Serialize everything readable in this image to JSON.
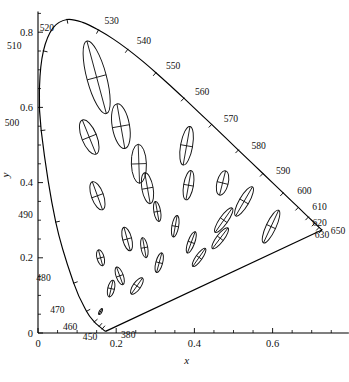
{
  "figure": {
    "title": "",
    "background_color": "#ffffff",
    "line_color": "#000000"
  },
  "axes": {
    "x_title": "x",
    "y_title": "y",
    "x_ticklabels": [
      "0",
      "0.2",
      "0.4",
      "0.6"
    ],
    "x_tickvalues": [
      0,
      0.2,
      0.4,
      0.6
    ],
    "y_ticklabels": [
      "0",
      "0.2",
      "0.4",
      "0.6",
      "0.8"
    ],
    "y_tickvalues": [
      0,
      0.2,
      0.4,
      0.6,
      0.8
    ],
    "x_minor_step": 0.05,
    "y_minor_step": 0.05,
    "xlim": [
      0,
      0.795
    ],
    "ylim": [
      0,
      0.855
    ],
    "grid": false
  },
  "chart_data": {
    "type": "scatter",
    "xlabel": "x",
    "ylabel": "y",
    "xlim": [
      0,
      0.795
    ],
    "ylim": [
      0,
      0.855
    ],
    "grid": false,
    "legend": "none",
    "spectral_locus": {
      "name": "Spectral locus (CIE 1931 2-deg)",
      "wavelength_labels": [
        380,
        450,
        460,
        470,
        480,
        490,
        500,
        510,
        520,
        530,
        540,
        550,
        560,
        570,
        580,
        590,
        600,
        610,
        620,
        630,
        650
      ],
      "points": [
        {
          "wl": 380,
          "x": 0.1741,
          "y": 0.005
        },
        {
          "wl": 390,
          "x": 0.1738,
          "y": 0.0049
        },
        {
          "wl": 400,
          "x": 0.1733,
          "y": 0.0048
        },
        {
          "wl": 410,
          "x": 0.1726,
          "y": 0.0048
        },
        {
          "wl": 420,
          "x": 0.1714,
          "y": 0.0051
        },
        {
          "wl": 430,
          "x": 0.1689,
          "y": 0.0069
        },
        {
          "wl": 440,
          "x": 0.1644,
          "y": 0.0109
        },
        {
          "wl": 450,
          "x": 0.1566,
          "y": 0.0177
        },
        {
          "wl": 460,
          "x": 0.144,
          "y": 0.0297
        },
        {
          "wl": 470,
          "x": 0.1241,
          "y": 0.0578
        },
        {
          "wl": 480,
          "x": 0.0913,
          "y": 0.1327
        },
        {
          "wl": 490,
          "x": 0.0454,
          "y": 0.295
        },
        {
          "wl": 500,
          "x": 0.0082,
          "y": 0.5384
        },
        {
          "wl": 505,
          "x": 0.0039,
          "y": 0.6548
        },
        {
          "wl": 510,
          "x": 0.0139,
          "y": 0.7502
        },
        {
          "wl": 515,
          "x": 0.0389,
          "y": 0.812
        },
        {
          "wl": 520,
          "x": 0.0743,
          "y": 0.8338
        },
        {
          "wl": 525,
          "x": 0.1142,
          "y": 0.8262
        },
        {
          "wl": 530,
          "x": 0.1547,
          "y": 0.8059
        },
        {
          "wl": 535,
          "x": 0.1929,
          "y": 0.7816
        },
        {
          "wl": 540,
          "x": 0.2296,
          "y": 0.7543
        },
        {
          "wl": 545,
          "x": 0.2658,
          "y": 0.7243
        },
        {
          "wl": 550,
          "x": 0.3016,
          "y": 0.6923
        },
        {
          "wl": 555,
          "x": 0.3373,
          "y": 0.6589
        },
        {
          "wl": 560,
          "x": 0.3731,
          "y": 0.6245
        },
        {
          "wl": 565,
          "x": 0.4087,
          "y": 0.5896
        },
        {
          "wl": 570,
          "x": 0.4441,
          "y": 0.5547
        },
        {
          "wl": 575,
          "x": 0.4788,
          "y": 0.5202
        },
        {
          "wl": 580,
          "x": 0.5125,
          "y": 0.4866
        },
        {
          "wl": 585,
          "x": 0.5448,
          "y": 0.4544
        },
        {
          "wl": 590,
          "x": 0.5752,
          "y": 0.4242
        },
        {
          "wl": 595,
          "x": 0.6029,
          "y": 0.3965
        },
        {
          "wl": 600,
          "x": 0.627,
          "y": 0.3725
        },
        {
          "wl": 605,
          "x": 0.6482,
          "y": 0.3514
        },
        {
          "wl": 610,
          "x": 0.6658,
          "y": 0.334
        },
        {
          "wl": 615,
          "x": 0.6801,
          "y": 0.3197
        },
        {
          "wl": 620,
          "x": 0.6915,
          "y": 0.3083
        },
        {
          "wl": 625,
          "x": 0.7006,
          "y": 0.2993
        },
        {
          "wl": 630,
          "x": 0.7079,
          "y": 0.292
        },
        {
          "wl": 635,
          "x": 0.714,
          "y": 0.2859
        },
        {
          "wl": 640,
          "x": 0.719,
          "y": 0.2809
        },
        {
          "wl": 645,
          "x": 0.723,
          "y": 0.277
        },
        {
          "wl": 650,
          "x": 0.726,
          "y": 0.274
        }
      ]
    },
    "purple_line": {
      "name": "Line of purples",
      "from": {
        "x": 0.726,
        "y": 0.274
      },
      "to": {
        "x": 0.1741,
        "y": 0.005
      }
    },
    "ellipses": {
      "name": "MacAdam ellipses (10x actual size)",
      "scale_note": "axes enlarged 10x",
      "items": [
        {
          "id": 1,
          "cx": 0.16,
          "cy": 0.057,
          "a": 0.0085,
          "b": 0.0035,
          "theta_deg": 62
        },
        {
          "id": 2,
          "cx": 0.187,
          "cy": 0.118,
          "a": 0.022,
          "b": 0.009,
          "theta_deg": 77
        },
        {
          "id": 3,
          "cx": 0.253,
          "cy": 0.125,
          "a": 0.025,
          "b": 0.01,
          "theta_deg": 55
        },
        {
          "id": 4,
          "cx": 0.15,
          "cy": 0.68,
          "a": 0.096,
          "b": 0.026,
          "theta_deg": 105
        },
        {
          "id": 5,
          "cx": 0.131,
          "cy": 0.521,
          "a": 0.047,
          "b": 0.02,
          "theta_deg": 112
        },
        {
          "id": 6,
          "cx": 0.212,
          "cy": 0.55,
          "a": 0.058,
          "b": 0.023,
          "theta_deg": 100
        },
        {
          "id": 7,
          "cx": 0.258,
          "cy": 0.45,
          "a": 0.05,
          "b": 0.02,
          "theta_deg": 92
        },
        {
          "id": 8,
          "cx": 0.152,
          "cy": 0.365,
          "a": 0.038,
          "b": 0.016,
          "theta_deg": 110
        },
        {
          "id": 9,
          "cx": 0.28,
          "cy": 0.385,
          "a": 0.04,
          "b": 0.015,
          "theta_deg": 100
        },
        {
          "id": 10,
          "cx": 0.38,
          "cy": 0.498,
          "a": 0.05,
          "b": 0.016,
          "theta_deg": 80
        },
        {
          "id": 11,
          "cx": 0.16,
          "cy": 0.2,
          "a": 0.021,
          "b": 0.0095,
          "theta_deg": 105
        },
        {
          "id": 12,
          "cx": 0.228,
          "cy": 0.25,
          "a": 0.031,
          "b": 0.012,
          "theta_deg": 105
        },
        {
          "id": 13,
          "cx": 0.305,
          "cy": 0.323,
          "a": 0.026,
          "b": 0.009,
          "theta_deg": 100
        },
        {
          "id": 14,
          "cx": 0.385,
          "cy": 0.393,
          "a": 0.038,
          "b": 0.013,
          "theta_deg": 80
        },
        {
          "id": 15,
          "cx": 0.472,
          "cy": 0.399,
          "a": 0.032,
          "b": 0.015,
          "theta_deg": 76
        },
        {
          "id": 16,
          "cx": 0.527,
          "cy": 0.35,
          "a": 0.043,
          "b": 0.013,
          "theta_deg": 60
        },
        {
          "id": 17,
          "cx": 0.475,
          "cy": 0.3,
          "a": 0.038,
          "b": 0.011,
          "theta_deg": 55
        },
        {
          "id": 18,
          "cx": 0.351,
          "cy": 0.284,
          "a": 0.028,
          "b": 0.009,
          "theta_deg": 80
        },
        {
          "id": 19,
          "cx": 0.272,
          "cy": 0.227,
          "a": 0.026,
          "b": 0.009,
          "theta_deg": 100
        },
        {
          "id": 20,
          "cx": 0.209,
          "cy": 0.152,
          "a": 0.024,
          "b": 0.0095,
          "theta_deg": 110
        },
        {
          "id": 21,
          "cx": 0.31,
          "cy": 0.187,
          "a": 0.026,
          "b": 0.009,
          "theta_deg": 75
        },
        {
          "id": 22,
          "cx": 0.392,
          "cy": 0.241,
          "a": 0.029,
          "b": 0.009,
          "theta_deg": 70
        },
        {
          "id": 23,
          "cx": 0.412,
          "cy": 0.201,
          "a": 0.028,
          "b": 0.0085,
          "theta_deg": 55
        },
        {
          "id": 24,
          "cx": 0.466,
          "cy": 0.252,
          "a": 0.033,
          "b": 0.01,
          "theta_deg": 53
        },
        {
          "id": 25,
          "cx": 0.596,
          "cy": 0.283,
          "a": 0.046,
          "b": 0.013,
          "theta_deg": 65
        }
      ]
    }
  },
  "annotations": {
    "wavelengths": [
      {
        "label": "380",
        "wl": 380,
        "dx": 15,
        "dy": 7
      },
      {
        "label": "450",
        "wl": 450,
        "dx": -2,
        "dy": 14
      },
      {
        "label": "460",
        "wl": 460,
        "dx": -17,
        "dy": 8
      },
      {
        "label": "470",
        "wl": 470,
        "dx": -22,
        "dy": 2
      },
      {
        "label": "480",
        "wl": 480,
        "dx": -23,
        "dy": -2
      },
      {
        "label": "490",
        "wl": 490,
        "dx": -23,
        "dy": -4
      },
      {
        "label": "500",
        "wl": 500,
        "dx": -22,
        "dy": -5
      },
      {
        "label": "510",
        "wl": 510,
        "dx": -22,
        "dy": -2
      },
      {
        "label": "520",
        "wl": 520,
        "dx": -13,
        "dy": 12
      },
      {
        "label": "530",
        "wl": 530,
        "dx": 6,
        "dy": -6
      },
      {
        "label": "540",
        "wl": 540,
        "dx": 9,
        "dy": -5
      },
      {
        "label": "550",
        "wl": 550,
        "dx": 10,
        "dy": -4
      },
      {
        "label": "560",
        "wl": 560,
        "dx": 11,
        "dy": -3
      },
      {
        "label": "570",
        "wl": 570,
        "dx": 12,
        "dy": -2
      },
      {
        "label": "580",
        "wl": 580,
        "dx": 13,
        "dy": -1
      },
      {
        "label": "590",
        "wl": 590,
        "dx": 13,
        "dy": 0
      },
      {
        "label": "600",
        "wl": 600,
        "dx": 14,
        "dy": 1
      },
      {
        "label": "610",
        "wl": 610,
        "dx": 14,
        "dy": 3
      },
      {
        "label": "620",
        "wl": 620,
        "dx": 4,
        "dy": 9
      },
      {
        "label": "630",
        "wl": 630,
        "dx": 0,
        "dy": 15
      },
      {
        "label": "650",
        "wl": 650,
        "dx": 9,
        "dy": 4
      }
    ]
  }
}
